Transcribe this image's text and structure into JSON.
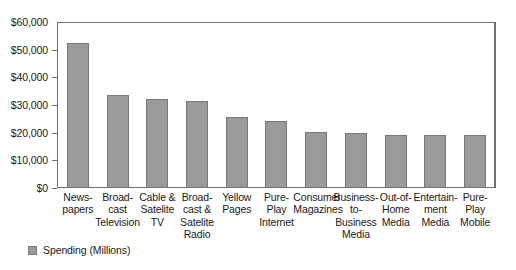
{
  "chart_data": {
    "type": "bar",
    "title": "",
    "subtitle": "",
    "xlabel": "",
    "ylabel": "",
    "ylim": [
      0,
      60000
    ],
    "ytick_step": 10000,
    "ytick_labels": [
      "$60,000",
      "$50,000",
      "$40,000",
      "$30,000",
      "$20,000",
      "$10,000",
      "$0"
    ],
    "ytick_values": [
      60000,
      50000,
      40000,
      30000,
      20000,
      10000,
      0
    ],
    "grid": false,
    "legend_position": "bottom-left",
    "categories": [
      "News-\npapers",
      "Broad-\ncast\nTelevision",
      "Cable &\nSatelite\nTV",
      "Broad-\ncast &\nSatelite\nRadio",
      "Yellow\nPages",
      "Pure-\nPlay\nInternet",
      "Consumer\nMagazines",
      "Business-\nto-\nBusiness\nMedia",
      "Out-of-\nHome\nMedia",
      "Entertain-\nment\nMedia",
      "Pure-\nPlay\nMobile"
    ],
    "series": [
      {
        "name": "Spending (Millions)",
        "color": "#9a9a9a",
        "values": [
          52500,
          33800,
          32000,
          31300,
          25500,
          24300,
          20400,
          19800,
          19300,
          19200,
          19200
        ]
      }
    ]
  },
  "legend": {
    "entries": [
      {
        "label": "Spending (Millions)",
        "color": "#9a9a9a"
      }
    ]
  }
}
